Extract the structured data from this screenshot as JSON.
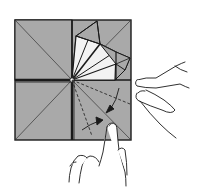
{
  "figure": {
    "title": "",
    "colors": {
      "paper": "#a9a9a9",
      "paper_light": "#f2f2f2",
      "line": "#1a1a1a",
      "background": "#ffffff"
    },
    "elements": {
      "square": "folded-paper-square",
      "fan": "collapsed-fan-top-right",
      "dashed_folds": "valley-fold-lines",
      "arrows": "fold-direction-arrows",
      "right_hand": "right-hand-holding-paper",
      "bottom_hand": "bottom-hand-pressing-fold"
    }
  }
}
